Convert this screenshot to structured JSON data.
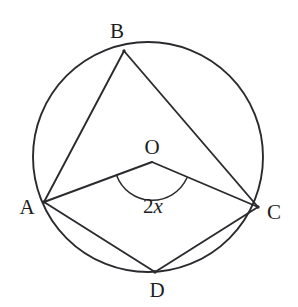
{
  "figure": {
    "type": "circle-geometry-diagram",
    "background_color": "#ffffff",
    "stroke_color": "#2b2b2f",
    "canvas": {
      "width": 298,
      "height": 307
    },
    "circle": {
      "center_x": 148,
      "center_y": 157,
      "radius": 115
    },
    "points": [
      {
        "id": "A",
        "label": "A",
        "x": 44,
        "y": 202,
        "label_x": 27,
        "label_y": 207
      },
      {
        "id": "B",
        "label": "B",
        "x": 124,
        "y": 51,
        "label_x": 117,
        "label_y": 31
      },
      {
        "id": "C",
        "label": "C",
        "x": 258,
        "y": 207,
        "label_x": 274,
        "label_y": 212
      },
      {
        "id": "D",
        "label": "D",
        "x": 155,
        "y": 272,
        "label_x": 157,
        "label_y": 290
      },
      {
        "id": "O",
        "label": "O",
        "x": 152,
        "y": 162,
        "label_x": 152,
        "label_y": 147
      }
    ],
    "segments": [
      {
        "id": "AB",
        "from": "A",
        "to": "B",
        "kind": "chord"
      },
      {
        "id": "BC",
        "from": "B",
        "to": "C",
        "kind": "chord"
      },
      {
        "id": "AD",
        "from": "A",
        "to": "D",
        "kind": "chord"
      },
      {
        "id": "DC",
        "from": "D",
        "to": "C",
        "kind": "chord"
      },
      {
        "id": "OA",
        "from": "O",
        "to": "A",
        "kind": "radius"
      },
      {
        "id": "OC",
        "from": "O",
        "to": "C",
        "kind": "radius"
      }
    ],
    "angle_mark": {
      "at": "O",
      "between": [
        "A",
        "C"
      ],
      "arc_radius": 38,
      "label_number": "2",
      "label_variable": "x",
      "label_x": 153,
      "label_y": 206
    }
  }
}
